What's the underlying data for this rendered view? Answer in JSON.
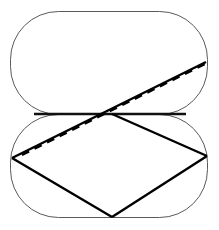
{
  "figure": {
    "title": "",
    "canvas": {
      "width": 219,
      "height": 230,
      "background": "#ffffff"
    },
    "colors": {
      "outline": "#5a5a5a",
      "solid_line": "#000000",
      "dashed_line": "#000000",
      "fill": "#ffffff"
    },
    "shapes": [
      {
        "name": "upper-stadium",
        "type": "rounded-rectangle",
        "x": 10.5,
        "y": 11.5,
        "width": 197,
        "height": 103,
        "corner_radius": 48,
        "stroke": "#5a5a5a",
        "stroke_width": 1,
        "fill": "#ffffff"
      },
      {
        "name": "lower-stadium",
        "type": "rounded-rectangle",
        "x": 10.5,
        "y": 114.5,
        "width": 197,
        "height": 103,
        "corner_radius": 48,
        "stroke": "#5a5a5a",
        "stroke_width": 1,
        "fill": "#ffffff"
      }
    ],
    "lines": [
      {
        "name": "horizontal-fold-line",
        "style": "solid",
        "points": [
          [
            34,
            114
          ],
          [
            186,
            114
          ]
        ],
        "stroke": "#111111",
        "stroke_width": 2.6
      },
      {
        "name": "rhombus-left-lower-edge",
        "style": "solid",
        "points": [
          [
            12,
            158
          ],
          [
            112,
            217
          ]
        ],
        "stroke": "#000000",
        "stroke_width": 2.4
      },
      {
        "name": "rhombus-right-lower-edge",
        "style": "solid",
        "points": [
          [
            112,
            217
          ],
          [
            207,
            156
          ]
        ],
        "stroke": "#000000",
        "stroke_width": 2.4
      },
      {
        "name": "rhombus-right-upper-edge",
        "style": "solid",
        "points": [
          [
            207,
            156
          ],
          [
            112,
            114
          ]
        ],
        "stroke": "#000000",
        "stroke_width": 2.4
      },
      {
        "name": "long-solid-diagonal",
        "style": "solid",
        "points": [
          [
            12,
            158
          ],
          [
            206,
            62
          ]
        ],
        "stroke": "#000000",
        "stroke_width": 2.4
      },
      {
        "name": "dashed-diagonal",
        "style": "dashed",
        "points": [
          [
            22,
            155
          ],
          [
            205,
            64
          ]
        ],
        "stroke": "#000000",
        "stroke_width": 2.2,
        "dash_pattern": "8 6"
      }
    ],
    "intersection_point": {
      "name": "crossing-point",
      "x": 112,
      "y": 114
    }
  }
}
